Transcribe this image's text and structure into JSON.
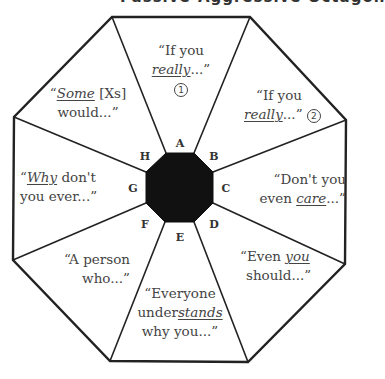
{
  "title": "Passive-Aggressive Octagon",
  "center_color": "#111111",
  "line_color": "#222222",
  "text_color": "#444444",
  "segments": [
    {
      "letter": "A",
      "line1": "“If you",
      "line2_pre": "",
      "line2_em": "really",
      "line2_post": "...”",
      "number": "1"
    },
    {
      "letter": "B",
      "line1": "“If you",
      "line2_pre": "",
      "line2_em": "really",
      "line2_post": "...”",
      "number": "2"
    },
    {
      "letter": "C",
      "line1": "“Don't you",
      "line2_pre": "even ",
      "line2_em": "care",
      "line2_post": "...”"
    },
    {
      "letter": "D",
      "line1_pre": "“Even ",
      "line1_em": "you",
      "line2": "should...”"
    },
    {
      "letter": "E",
      "line1": "“Everyone",
      "line2_pre": "under",
      "line2_em": "stands",
      "line3": "why you...”"
    },
    {
      "letter": "F",
      "line1": "“A person",
      "line2": "who...”"
    },
    {
      "letter": "G",
      "line1_pre": "“",
      "line1_em": "Why",
      "line1_post": " don't",
      "line2": "you ever...”"
    },
    {
      "letter": "H",
      "line1_pre": "“",
      "line1_em": "Some",
      "line1_post": " [Xs]",
      "line2": "would...”"
    }
  ]
}
